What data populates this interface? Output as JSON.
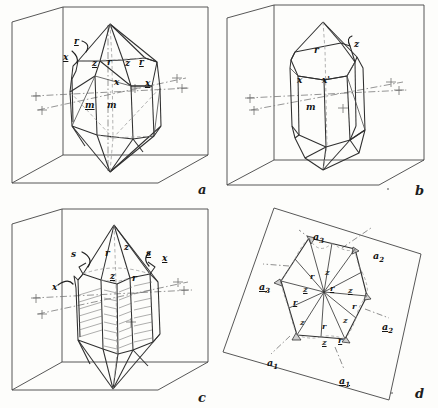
{
  "figure": {
    "caption_letters": [
      "a",
      "b",
      "c",
      "d"
    ],
    "ink_color": "#2b2b2b",
    "box_color": "#3a3a3a",
    "axis_color": "#6b6b6b",
    "paper_color": "#fdfdfb"
  },
  "panels": [
    {
      "letter": "a",
      "name": "panel-a",
      "description": "Quartz crystal with prism and rhombohedral terminations inside reference box",
      "labels": [
        {
          "text": "r",
          "underlined": true,
          "x": 74,
          "y": 37
        },
        {
          "text": "x",
          "underlined": true,
          "x": 63,
          "y": 53
        },
        {
          "text": "z",
          "underlined": true,
          "x": 92,
          "y": 59
        },
        {
          "text": "r",
          "underlined": false,
          "x": 107,
          "y": 58
        },
        {
          "text": "z",
          "underlined": false,
          "x": 125,
          "y": 59
        },
        {
          "text": "r",
          "underlined": true,
          "x": 139,
          "y": 58
        },
        {
          "text": "x",
          "underlined": false,
          "x": 114,
          "y": 78
        },
        {
          "text": "x",
          "underlined": true,
          "x": 145,
          "y": 79
        },
        {
          "text": "m",
          "underlined": true,
          "x": 85,
          "y": 101
        },
        {
          "text": "m",
          "underlined": false,
          "x": 107,
          "y": 101
        }
      ]
    },
    {
      "letter": "b",
      "name": "panel-b",
      "description": "Quartz crystal showing large r face with x and x-prime faces",
      "labels": [
        {
          "text": "r",
          "underlined": false,
          "x": 314,
          "y": 46
        },
        {
          "text": "z",
          "underlined": false,
          "x": 354,
          "y": 40
        },
        {
          "text": "x",
          "underlined": false,
          "x": 297,
          "y": 76
        },
        {
          "text": "x'",
          "underlined": false,
          "x": 322,
          "y": 76
        },
        {
          "text": "m",
          "underlined": false,
          "x": 306,
          "y": 103
        }
      ]
    },
    {
      "letter": "c",
      "name": "panel-c",
      "description": "Striated quartz crystal with s and x trapezohedral faces",
      "labels": [
        {
          "text": "s",
          "underlined": false,
          "x": 71,
          "y": 250
        },
        {
          "text": "r",
          "underlined": false,
          "x": 105,
          "y": 249
        },
        {
          "text": "z",
          "underlined": false,
          "x": 124,
          "y": 243
        },
        {
          "text": "s",
          "underlined": true,
          "x": 146,
          "y": 249
        },
        {
          "text": "x",
          "underlined": true,
          "x": 162,
          "y": 254
        },
        {
          "text": "z",
          "underlined": true,
          "x": 110,
          "y": 272
        },
        {
          "text": "r",
          "underlined": false,
          "x": 132,
          "y": 274
        },
        {
          "text": "x",
          "underlined": false,
          "x": 52,
          "y": 283
        }
      ]
    },
    {
      "letter": "d",
      "name": "panel-d",
      "description": "Basal projection of quartz showing twelve sectors and crystallographic axes",
      "axis_labels": [
        {
          "text": "a",
          "sub": "3",
          "underlined": false,
          "x": 313,
          "y": 232
        },
        {
          "text": "a",
          "sub": "2",
          "underlined": false,
          "x": 373,
          "y": 251
        },
        {
          "text": "a",
          "sub": "3",
          "underlined": true,
          "x": 259,
          "y": 282
        },
        {
          "text": "a",
          "sub": "2",
          "underlined": true,
          "x": 382,
          "y": 322
        },
        {
          "text": "a",
          "sub": "1",
          "underlined": false,
          "x": 267,
          "y": 358
        },
        {
          "text": "a",
          "sub": "1",
          "underlined": true,
          "x": 339,
          "y": 376
        }
      ],
      "face_labels": [
        {
          "text": "r",
          "underlined": false,
          "x": 310,
          "y": 272
        },
        {
          "text": "z",
          "underlined": false,
          "x": 325,
          "y": 268
        },
        {
          "text": "z",
          "underlined": true,
          "x": 303,
          "y": 285
        },
        {
          "text": "r",
          "underlined": true,
          "x": 330,
          "y": 284
        },
        {
          "text": "z",
          "underlined": true,
          "x": 348,
          "y": 286
        },
        {
          "text": "r",
          "underlined": true,
          "x": 293,
          "y": 298
        },
        {
          "text": "r",
          "underlined": false,
          "x": 352,
          "y": 302
        },
        {
          "text": "z",
          "underlined": false,
          "x": 300,
          "y": 318
        },
        {
          "text": "z",
          "underlined": false,
          "x": 343,
          "y": 316
        },
        {
          "text": "r",
          "underlined": false,
          "x": 322,
          "y": 322
        },
        {
          "text": "z",
          "underlined": true,
          "x": 322,
          "y": 338
        },
        {
          "text": "r",
          "underlined": true,
          "x": 338,
          "y": 336
        }
      ]
    }
  ]
}
